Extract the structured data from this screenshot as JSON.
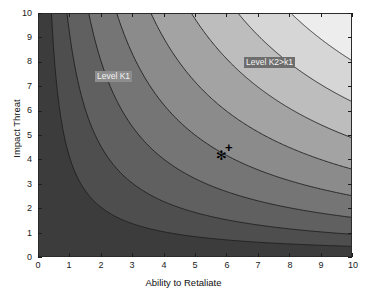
{
  "chart_data": {
    "type": "heatmap",
    "subtype": "filled-contour",
    "title": "",
    "xlabel": "Ability to Retaliate",
    "ylabel": "Impact Threat",
    "xlim": [
      0,
      10
    ],
    "ylim": [
      0,
      10
    ],
    "xticks": [
      "0",
      "1",
      "2",
      "3",
      "4",
      "5",
      "6",
      "7",
      "8",
      "9",
      "10"
    ],
    "yticks": [
      "0",
      "1",
      "2",
      "3",
      "4",
      "5",
      "6",
      "7",
      "8",
      "9",
      "10"
    ],
    "grid": false,
    "legend": "none",
    "colormap": "gray",
    "function": "z = x * y",
    "contour_levels": [
      4,
      9,
      16,
      25,
      36,
      49,
      64,
      81
    ],
    "band_colors": [
      "#3c3c3c",
      "#4e4e4e",
      "#606060",
      "#757575",
      "#8b8b8b",
      "#a3a3a3",
      "#bdbdbd",
      "#d6d6d6",
      "#ededed"
    ],
    "contour_line_color": "#1f1f1f",
    "annotations": [
      {
        "name": "level-k1-label",
        "text": "Level K1",
        "x": 1.2,
        "y": 8.0
      },
      {
        "name": "level-k2-label",
        "text": "Level K2>k1",
        "x": 6.0,
        "y": 8.6
      }
    ],
    "markers": [
      {
        "name": "star-marker",
        "symbol": "*",
        "x": 4.95,
        "y": 4.85
      },
      {
        "name": "plus-marker",
        "symbol": "+",
        "x": 5.25,
        "y": 5.15
      },
      {
        "name": "circle-marker",
        "symbol": "o",
        "x": 6.6,
        "y": 8.1
      }
    ]
  },
  "axes": {
    "xlabel": "Ability to Retaliate",
    "ylabel": "Impact Threat",
    "xticks": [
      "0",
      "1",
      "2",
      "3",
      "4",
      "5",
      "6",
      "7",
      "8",
      "9",
      "10"
    ],
    "yticks": [
      "10",
      "9",
      "8",
      "7",
      "6",
      "5",
      "4",
      "3",
      "2",
      "1",
      "0"
    ]
  },
  "annotations": {
    "k1": "Level K1",
    "k2": "Level K2>k1"
  },
  "markers": {
    "star": "✻",
    "plus": "+"
  }
}
